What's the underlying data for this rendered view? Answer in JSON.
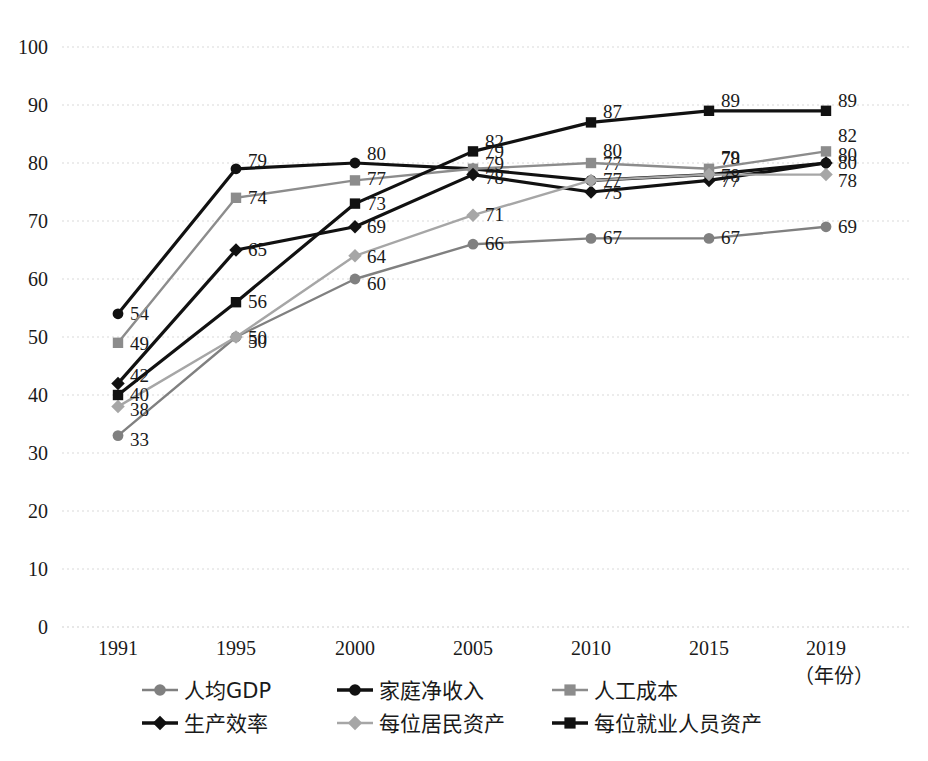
{
  "chart_data": {
    "type": "line",
    "title": "",
    "xlabel": "（年份）",
    "ylabel": "",
    "x": [
      "1991",
      "1995",
      "2000",
      "2005",
      "2010",
      "2015",
      "2019"
    ],
    "categories": [
      "1991",
      "1995",
      "2000",
      "2005",
      "2010",
      "2015",
      "2019"
    ],
    "ylim": [
      0,
      100
    ],
    "yticks": [
      "0",
      "10",
      "20",
      "30",
      "40",
      "50",
      "60",
      "70",
      "80",
      "90",
      "100"
    ],
    "grid": true,
    "legend_position": "bottom",
    "show_data_labels": true,
    "series": [
      {
        "name": "人均GDP",
        "marker": "circle",
        "color": "#808080",
        "values": [
          33,
          50,
          60,
          66,
          67,
          67,
          69
        ],
        "labels": [
          "33",
          "50",
          "60",
          "66",
          "67",
          "67",
          "69"
        ]
      },
      {
        "name": "家庭净收入",
        "marker": "circle",
        "color": "#111111",
        "values": [
          54,
          79,
          80,
          79,
          77,
          78,
          80
        ],
        "labels": [
          "54",
          "79",
          "80",
          "79",
          "77",
          "78",
          "80"
        ]
      },
      {
        "name": "人工成本",
        "marker": "square",
        "color": "#8c8c8c",
        "values": [
          49,
          74,
          77,
          79,
          80,
          79,
          82
        ],
        "labels": [
          "49",
          "74",
          "77",
          "79",
          "80",
          "79",
          "82"
        ]
      },
      {
        "name": "生产效率",
        "marker": "diamond",
        "color": "#111111",
        "values": [
          42,
          65,
          69,
          78,
          75,
          77,
          80
        ],
        "labels": [
          "42",
          "65",
          "69",
          "78",
          "75",
          "77",
          "80"
        ]
      },
      {
        "name": "每位居民资产",
        "marker": "diamond",
        "color": "#a6a6a6",
        "values": [
          38,
          50,
          64,
          71,
          77,
          78,
          78
        ],
        "labels": [
          "38",
          "50",
          "64",
          "71",
          "77",
          "78",
          "78"
        ]
      },
      {
        "name": "每位就业人员资产",
        "marker": "square",
        "color": "#111111",
        "values": [
          40,
          56,
          73,
          82,
          87,
          89,
          89
        ],
        "labels": [
          "40",
          "56",
          "73",
          "82",
          "87",
          "89",
          "89"
        ]
      }
    ]
  },
  "legend": {
    "items": [
      "人均GDP",
      "家庭净收入",
      "人工成本",
      "生产效率",
      "每位居民资产",
      "每位就业人员资产"
    ]
  }
}
